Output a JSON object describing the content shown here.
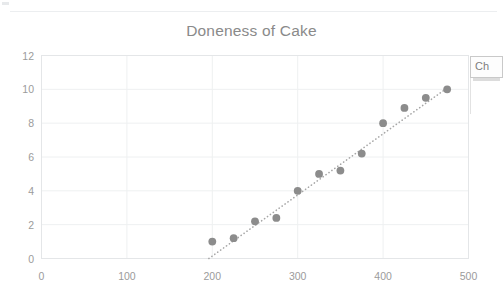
{
  "chart_data": {
    "type": "scatter",
    "title": "Doneness of Cake",
    "xlabel": "",
    "ylabel": "",
    "xlim": [
      0,
      500
    ],
    "ylim": [
      0,
      12
    ],
    "xticks": [
      0,
      100,
      200,
      300,
      400,
      500
    ],
    "yticks": [
      0,
      2,
      4,
      6,
      8,
      10,
      12
    ],
    "grid": "horizontal-and-vertical",
    "legend": "none",
    "marker_color": "#8c8c8c",
    "trendline_color": "#a6a6a6",
    "trendline_style": "dotted",
    "series": [
      {
        "name": "Doneness",
        "points": [
          {
            "x": 200,
            "y": 1.0
          },
          {
            "x": 225,
            "y": 1.2
          },
          {
            "x": 250,
            "y": 2.2
          },
          {
            "x": 275,
            "y": 2.4
          },
          {
            "x": 300,
            "y": 4.0
          },
          {
            "x": 325,
            "y": 5.0
          },
          {
            "x": 350,
            "y": 5.2
          },
          {
            "x": 375,
            "y": 6.2
          },
          {
            "x": 400,
            "y": 8.0
          },
          {
            "x": 425,
            "y": 8.9
          },
          {
            "x": 450,
            "y": 9.5
          },
          {
            "x": 475,
            "y": 10.0
          }
        ]
      }
    ],
    "trendline": {
      "x_start": 196,
      "y_start": 0.0,
      "x_end": 477,
      "y_end": 10.15
    }
  },
  "callout": {
    "label": "Ch"
  }
}
